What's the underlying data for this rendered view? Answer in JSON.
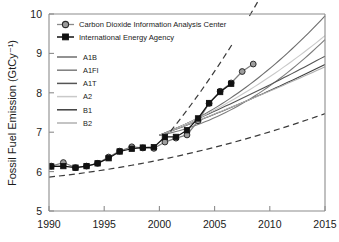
{
  "chart_data": {
    "type": "line",
    "title": "",
    "xlabel": "",
    "ylabel": "Fossil Fuel Emission (GtCy⁻¹)",
    "xlim": [
      1990,
      2015
    ],
    "ylim": [
      5,
      10
    ],
    "xticks": [
      1990,
      1995,
      2000,
      2005,
      2010,
      2015
    ],
    "yticks": [
      5,
      6,
      7,
      8,
      9,
      10
    ],
    "grid": false,
    "legend_position": "top-left",
    "series": [
      {
        "name": "Carbon Dioxide Information Analysis Center",
        "marker": "circle",
        "color": "#8a8a8a",
        "x": [
          1990.2,
          1991.3,
          1992.4,
          1993.4,
          1994.4,
          1995.4,
          1996.4,
          1997.5,
          1998.5,
          1999.5,
          2000.5,
          2001.5,
          2002.5,
          2003.5,
          2004.5,
          2005.5,
          2006.5,
          2007.5,
          2008.5
        ],
        "y": [
          6.14,
          6.23,
          6.1,
          6.14,
          6.21,
          6.37,
          6.52,
          6.63,
          6.6,
          6.59,
          6.75,
          6.85,
          6.93,
          7.29,
          7.73,
          8.04,
          8.25,
          8.54,
          8.73
        ]
      },
      {
        "name": "International Energy Agency",
        "marker": "square",
        "color": "#111111",
        "x": [
          1990.2,
          1991.3,
          1992.4,
          1993.4,
          1994.4,
          1995.4,
          1996.4,
          1997.5,
          1998.5,
          1999.5,
          2000.5,
          2001.5,
          2002.5,
          2003.5,
          2004.5,
          2005.5,
          2006.5
        ],
        "y": [
          6.13,
          6.14,
          6.1,
          6.14,
          6.21,
          6.34,
          6.51,
          6.58,
          6.61,
          6.62,
          6.88,
          6.88,
          7.05,
          7.35,
          7.74,
          8.02,
          8.23
        ]
      }
    ],
    "scenarios": [
      {
        "name": "A1B",
        "color": "#6e6e6e",
        "y2000": 6.92,
        "y2015": 9.95,
        "curvature": 0.3
      },
      {
        "name": "A1FI",
        "color": "#7d7d7d",
        "y2000": 6.92,
        "y2015": 9.35,
        "curvature": 0.42
      },
      {
        "name": "A1T",
        "color": "#555555",
        "y2000": 6.92,
        "y2015": 8.93,
        "curvature": 0.08
      },
      {
        "name": "A2",
        "color": "#c9c9c9",
        "y2000": 6.92,
        "y2015": 9.45,
        "curvature": 0.22
      },
      {
        "name": "B1",
        "color": "#3f3f3f",
        "y2000": 6.92,
        "y2015": 8.72,
        "curvature": 0.1
      },
      {
        "name": "B2",
        "color": "#b0b0b0",
        "y2000": 6.92,
        "y2015": 8.66,
        "curvature": 0.06
      }
    ],
    "envelopes": [
      {
        "name": "upper-bound-dashed",
        "style": "dashed",
        "x": [
          2001.0,
          2015.0
        ],
        "y": [
          7.02,
          13.6
        ]
      },
      {
        "name": "lower-bound-dashed",
        "style": "dashed",
        "x": [
          1990.0,
          2015.0
        ],
        "y": [
          5.86,
          7.47
        ]
      }
    ],
    "annotations": []
  },
  "legend": {
    "observations": [
      {
        "label": "Carbon Dioxide Information Analysis Center",
        "marker": "circle"
      },
      {
        "label": "International Energy Agency",
        "marker": "square"
      }
    ],
    "scenario_labels": [
      "A1B",
      "A1FI",
      "A1T",
      "A2",
      "B1",
      "B2"
    ]
  },
  "axes": {
    "y_title": "Fossil Fuel Emission (GtCy⁻¹)",
    "y_ticklabels": [
      "10",
      "9",
      "8",
      "7",
      "6",
      "5"
    ],
    "x_ticklabels": [
      "1990",
      "1995",
      "2000",
      "2005",
      "2010",
      "2015"
    ]
  }
}
